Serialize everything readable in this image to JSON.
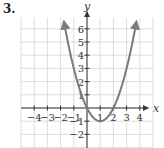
{
  "problem_number": "3.",
  "chart_data": {
    "type": "line",
    "title": "",
    "xlabel": "x",
    "ylabel": "y",
    "xlim": [
      -5,
      5
    ],
    "ylim": [
      -3,
      7
    ],
    "grid": true,
    "x_ticks": [
      -4,
      -3,
      -2,
      -1,
      1,
      2,
      3,
      4
    ],
    "x_tick_labels": [
      "−4",
      "−3",
      "−2",
      "−1",
      "1",
      "2",
      "3",
      "4"
    ],
    "y_ticks": [
      -2,
      -1,
      1,
      2,
      3,
      4,
      5,
      6
    ],
    "y_tick_labels": [
      "−2",
      "−1",
      "1",
      "2",
      "3",
      "4",
      "5",
      "6"
    ],
    "series": [
      {
        "name": "y = x^2 - 2x",
        "function": "x^2 - 2x",
        "vertex": [
          1,
          -1
        ],
        "x_intercepts": [
          0,
          2
        ],
        "x_range": [
          -1.72,
          3.72
        ],
        "arrows_both_ends": true,
        "color": "#7a7a7a"
      }
    ],
    "axis_color": "#333333",
    "grid_color": "#d4d4d4"
  }
}
